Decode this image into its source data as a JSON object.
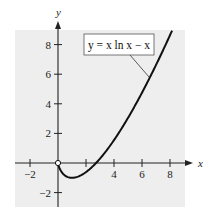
{
  "chart_data": {
    "type": "line",
    "title": "",
    "xlabel": "x",
    "ylabel": "y",
    "xlim": [
      -3,
      9.2
    ],
    "ylim": [
      -3,
      9
    ],
    "grid": false,
    "background": "#eeeeee",
    "x_ticks": [
      -2,
      2,
      4,
      6,
      8
    ],
    "x_tick_labels": [
      "-2",
      "",
      "4",
      "6",
      "8"
    ],
    "y_ticks": [
      -2,
      2,
      4,
      6,
      8
    ],
    "y_tick_labels": [
      "-2",
      "2",
      "4",
      "6",
      "8"
    ],
    "series": [
      {
        "name": "y = x ln x − x",
        "function": "x*ln(x) - x",
        "domain": [
          0,
          8.15
        ],
        "open_endpoint": [
          0,
          0
        ],
        "minimum": [
          1,
          -1
        ],
        "x_intercept": 2.718,
        "points": [
          [
            0,
            0
          ],
          [
            0.1,
            -0.33
          ],
          [
            0.25,
            -0.6
          ],
          [
            0.5,
            -0.85
          ],
          [
            1,
            -1
          ],
          [
            1.5,
            -0.89
          ],
          [
            2,
            -0.61
          ],
          [
            2.718,
            0
          ],
          [
            3,
            0.3
          ],
          [
            4,
            1.55
          ],
          [
            5,
            3.05
          ],
          [
            6,
            4.75
          ],
          [
            7,
            6.62
          ],
          [
            8,
            8.64
          ]
        ],
        "color": "#111111"
      }
    ],
    "annotations": [
      {
        "text": "y = x ln x − x",
        "boxed": true,
        "points_to": [
          6.6,
          5.8
        ]
      }
    ]
  },
  "labels": {
    "x_axis": "x",
    "y_axis": "y",
    "equation": "y = x ln x − x"
  }
}
